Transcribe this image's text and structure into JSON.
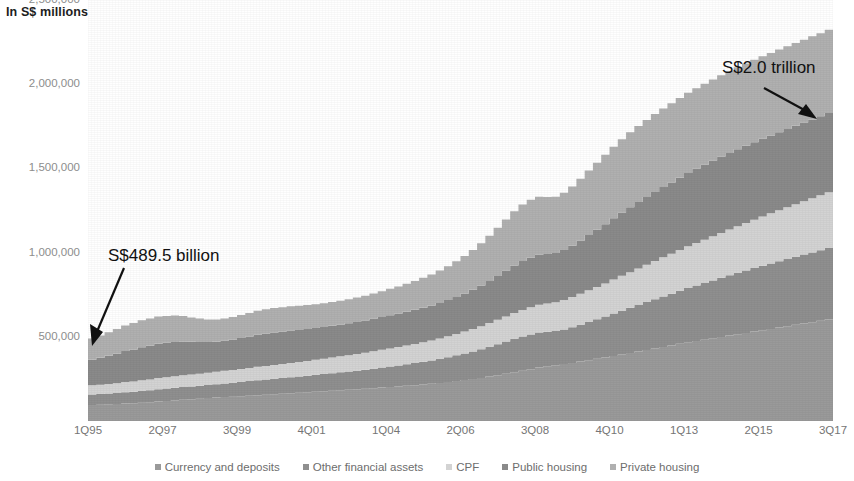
{
  "chart_data": {
    "type": "area",
    "title": "",
    "subtitle": "",
    "axis_title": "In S$ millions",
    "xlabel": "",
    "ylabel": "In S$ millions",
    "stacked": true,
    "grid": false,
    "legend_position": "bottom",
    "ylim": [
      0,
      2500000
    ],
    "yticks": [
      "2,500,000",
      "2,000,000",
      "1,500,000",
      "1,000,000",
      "500,000"
    ],
    "ytick_values": [
      2500000,
      2000000,
      1500000,
      1000000,
      500000
    ],
    "xticks": [
      "1Q95",
      "2Q97",
      "3Q99",
      "4Q01",
      "1Q04",
      "2Q06",
      "3Q08",
      "4Q10",
      "1Q13",
      "2Q15",
      "3Q17"
    ],
    "xtick_index": [
      0,
      9,
      18,
      27,
      36,
      45,
      54,
      63,
      72,
      81,
      90
    ],
    "x": [
      "1Q95",
      "2Q95",
      "3Q95",
      "4Q95",
      "1Q96",
      "2Q96",
      "3Q96",
      "4Q96",
      "1Q97",
      "2Q97",
      "3Q97",
      "4Q97",
      "1Q98",
      "2Q98",
      "3Q98",
      "4Q98",
      "1Q99",
      "2Q99",
      "3Q99",
      "4Q99",
      "1Q00",
      "2Q00",
      "3Q00",
      "4Q00",
      "1Q01",
      "2Q01",
      "3Q01",
      "4Q01",
      "1Q02",
      "2Q02",
      "3Q02",
      "4Q02",
      "1Q03",
      "2Q03",
      "3Q03",
      "4Q03",
      "1Q04",
      "2Q04",
      "3Q04",
      "4Q04",
      "1Q05",
      "2Q05",
      "3Q05",
      "4Q05",
      "1Q06",
      "2Q06",
      "3Q06",
      "4Q06",
      "1Q07",
      "2Q07",
      "3Q07",
      "4Q07",
      "1Q08",
      "2Q08",
      "3Q08",
      "4Q08",
      "1Q09",
      "2Q09",
      "3Q09",
      "4Q09",
      "1Q10",
      "2Q10",
      "3Q10",
      "4Q10",
      "1Q11",
      "2Q11",
      "3Q11",
      "4Q11",
      "1Q12",
      "2Q12",
      "3Q12",
      "4Q12",
      "1Q13",
      "2Q13",
      "3Q13",
      "4Q13",
      "1Q14",
      "2Q14",
      "3Q14",
      "4Q14",
      "1Q15",
      "2Q15",
      "3Q15",
      "4Q15",
      "1Q16",
      "2Q16",
      "3Q16",
      "4Q16",
      "1Q17",
      "2Q17",
      "3Q17"
    ],
    "series": [
      {
        "name": "Currency and deposits",
        "color": "#9a9a9a",
        "values": [
          95000,
          97000,
          99000,
          101000,
          104000,
          106000,
          109000,
          112000,
          116000,
          119000,
          122000,
          126000,
          129000,
          132000,
          136000,
          139000,
          142000,
          144000,
          147000,
          150000,
          153000,
          156000,
          159000,
          162000,
          165000,
          168000,
          171000,
          174000,
          177000,
          180000,
          183000,
          186000,
          189000,
          192000,
          195000,
          199000,
          202000,
          205000,
          209000,
          213000,
          217000,
          221000,
          226000,
          231000,
          237000,
          243000,
          249000,
          256000,
          264000,
          272000,
          281000,
          290000,
          299000,
          308000,
          317000,
          325000,
          331000,
          338000,
          345000,
          353000,
          361000,
          369000,
          377000,
          386000,
          395000,
          404000,
          413000,
          422000,
          431000,
          440000,
          449000,
          458000,
          467000,
          475000,
          483000,
          491000,
          499000,
          507000,
          515000,
          523000,
          531000,
          539000,
          547000,
          555000,
          563000,
          571000,
          579000,
          587000,
          595000,
          603000,
          612000
        ]
      },
      {
        "name": "Other financial assets",
        "color": "#8f8f8f",
        "values": [
          62000,
          63000,
          64000,
          65000,
          67000,
          68000,
          70000,
          71000,
          73000,
          74000,
          75000,
          76000,
          76000,
          77000,
          78000,
          79000,
          81000,
          83000,
          85000,
          87000,
          89000,
          90000,
          92000,
          93000,
          95000,
          96000,
          98000,
          100000,
          102000,
          104000,
          106000,
          108000,
          110000,
          113000,
          116000,
          119000,
          122000,
          125000,
          128000,
          131000,
          135000,
          139000,
          143000,
          148000,
          153000,
          158000,
          164000,
          170000,
          177000,
          184000,
          191000,
          198000,
          203000,
          206000,
          208000,
          205000,
          203000,
          206000,
          212000,
          219000,
          227000,
          235000,
          243000,
          252000,
          260000,
          268000,
          276000,
          284000,
          292000,
          300000,
          307000,
          315000,
          323000,
          330000,
          337000,
          344000,
          351000,
          358000,
          365000,
          371000,
          377000,
          383000,
          389000,
          394000,
          399000,
          404000,
          409000,
          414000,
          419000,
          424000,
          430000
        ]
      },
      {
        "name": "CPF",
        "color": "#d3d3d3",
        "values": [
          55000,
          56000,
          57000,
          58000,
          60000,
          61000,
          63000,
          64000,
          66000,
          67000,
          69000,
          70000,
          71000,
          72000,
          73000,
          74000,
          75000,
          76000,
          77000,
          78000,
          80000,
          81000,
          82000,
          83000,
          85000,
          86000,
          88000,
          89000,
          91000,
          93000,
          95000,
          97000,
          99000,
          101000,
          103000,
          105000,
          107000,
          109000,
          111000,
          113000,
          116000,
          118000,
          121000,
          124000,
          127000,
          130000,
          133000,
          137000,
          141000,
          145000,
          149000,
          153000,
          157000,
          161000,
          165000,
          168000,
          171000,
          175000,
          179000,
          183000,
          188000,
          192000,
          197000,
          202000,
          207000,
          212000,
          217000,
          222000,
          227000,
          232000,
          237000,
          242000,
          247000,
          252000,
          257000,
          262000,
          267000,
          272000,
          277000,
          282000,
          287000,
          292000,
          297000,
          302000,
          307000,
          312000,
          317000,
          322000,
          327000,
          332000,
          338000
        ]
      },
      {
        "name": "Public housing",
        "color": "#8a8a8a",
        "values": [
          152000,
          160000,
          168000,
          176000,
          184000,
          190000,
          196000,
          200000,
          203000,
          204000,
          203000,
          200000,
          194000,
          188000,
          182000,
          179000,
          179000,
          181000,
          184000,
          187000,
          190000,
          192000,
          193000,
          193000,
          192000,
          191000,
          190000,
          189000,
          188000,
          188000,
          188000,
          189000,
          190000,
          191000,
          193000,
          195000,
          197000,
          199000,
          201000,
          203000,
          205000,
          208000,
          211000,
          215000,
          220000,
          226000,
          233000,
          241000,
          250000,
          260000,
          271000,
          282000,
          291000,
          296000,
          297000,
          294000,
          292000,
          296000,
          305000,
          316000,
          328000,
          340000,
          352000,
          364000,
          375000,
          385000,
          394000,
          402000,
          410000,
          417000,
          424000,
          430000,
          436000,
          441000,
          445000,
          449000,
          452000,
          455000,
          457000,
          459000,
          461000,
          462000,
          463000,
          464000,
          465000,
          466000,
          467000,
          468000,
          469000,
          470000,
          472000
        ]
      },
      {
        "name": "Private housing",
        "color": "#b0b0b0",
        "values": [
          125500,
          132000,
          139000,
          146000,
          152000,
          157000,
          160000,
          162000,
          162000,
          160000,
          157000,
          152000,
          145000,
          139000,
          134000,
          131000,
          131000,
          133000,
          136000,
          139000,
          142000,
          144000,
          145000,
          145000,
          144000,
          143000,
          142000,
          141000,
          141000,
          141000,
          142000,
          143000,
          145000,
          147000,
          150000,
          153000,
          157000,
          161000,
          166000,
          171000,
          177000,
          184000,
          192000,
          201000,
          211000,
          223000,
          236000,
          251000,
          268000,
          286000,
          305000,
          323000,
          336000,
          343000,
          344000,
          338000,
          334000,
          340000,
          352000,
          367000,
          383000,
          398000,
          412000,
          425000,
          436000,
          445000,
          452000,
          458000,
          463000,
          467000,
          470000,
          473000,
          476000,
          478000,
          480000,
          482000,
          484000,
          486000,
          487000,
          488000,
          489000,
          490000,
          490000,
          491000,
          491000,
          492000,
          492000,
          493000,
          493000,
          494000,
          495000
        ]
      }
    ],
    "annotations": [
      {
        "id": "start",
        "text": "S$489.5 billion",
        "points_to": "1Q95"
      },
      {
        "id": "end",
        "text": "S$2.0 trillion",
        "points_to": "3Q17"
      }
    ]
  },
  "legend": {
    "items": [
      {
        "label": "Currency and deposits",
        "color": "#9a9a9a"
      },
      {
        "label": "Other financial assets",
        "color": "#8f8f8f"
      },
      {
        "label": "CPF",
        "color": "#d3d3d3"
      },
      {
        "label": "Public housing",
        "color": "#8a8a8a"
      },
      {
        "label": "Private housing",
        "color": "#b0b0b0"
      }
    ]
  }
}
